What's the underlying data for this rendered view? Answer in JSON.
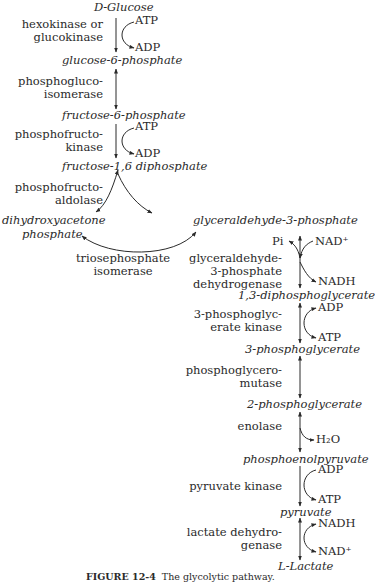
{
  "metabolites": {
    "glucose_prefix": "D",
    "glucose": "-Glucose",
    "g6p": "glucose-6-phosphate",
    "f6p": "fructose-6-phosphate",
    "f16dp": "fructose-1,6 diphosphate",
    "dhap_line1": "dihydroxyacetone",
    "dhap_line2": "phosphate",
    "g3p": "glyceraldehyde-3-phosphate",
    "bpg": "1,3-diphosphoglycerate",
    "pg3": "3-phosphoglycerate",
    "pg2": "2-phosphoglycerate",
    "pep": "phosphoenolpyruvate",
    "pyruvate": "pyruvate",
    "lactate_prefix": "L",
    "lactate": "-Lactate"
  },
  "enzymes": {
    "hexokinase": [
      "hexokinase or",
      "glucokinase"
    ],
    "pgi": [
      "phosphogluco-",
      "isomerase"
    ],
    "pfk": [
      "phosphofructo-",
      "kinase"
    ],
    "aldolase": [
      "phosphofructo-",
      "aldolase"
    ],
    "tpi": [
      "triosephosphate",
      "isomerase"
    ],
    "gapdh": [
      "glyceraldehyde-",
      "3-phosphate",
      "dehydrogenase"
    ],
    "pgk": [
      "3-phosphoglyc-",
      "erate kinase"
    ],
    "pgm": [
      "phosphoglycero-",
      "mutase"
    ],
    "enolase": [
      "enolase"
    ],
    "pk": [
      "pyruvate kinase"
    ],
    "ldh": [
      "lactate dehydro-",
      "genase"
    ]
  },
  "cofactors": {
    "hk_in": "ATP",
    "hk_out": "ADP",
    "pfk_in": "ATP",
    "pfk_out": "ADP",
    "gapdh_pi": "Pi",
    "gapdh_in": "NAD⁺",
    "gapdh_out": "NADH",
    "pgk_in": "ADP",
    "pgk_out": "ATP",
    "enolase_out": "H₂O",
    "pk_in": "ADP",
    "pk_out": "ATP",
    "ldh_in": "NADH",
    "ldh_out": "NAD⁺"
  },
  "caption": {
    "label": "FIGURE 12-4",
    "text": "The glycolytic pathway."
  }
}
